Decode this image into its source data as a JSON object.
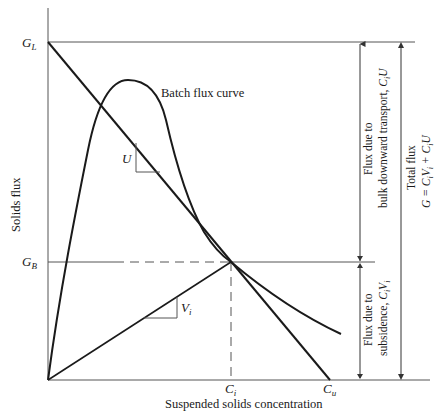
{
  "diagram": {
    "type": "solids flux analysis (batch flux curve with underflow operating line)",
    "axes": {
      "ylabel": "Solids flux",
      "xlabel": "Suspended solids concentration"
    },
    "y_ticks": {
      "GL": {
        "main": "G",
        "sub": "L"
      },
      "GB": {
        "main": "G",
        "sub": "B"
      }
    },
    "x_ticks": {
      "Ci": {
        "main": "C",
        "sub": "i"
      },
      "Cu": {
        "main": "C",
        "sub": "u"
      }
    },
    "curve_label": "Batch flux curve",
    "slope_labels": {
      "U": "U",
      "Vi": {
        "main": "V",
        "sub": "i"
      }
    },
    "annotations": {
      "bulk": {
        "line1": "Flux due to",
        "line2": "bulk downward transport, ",
        "expr_main": "C",
        "expr_sub": "i",
        "expr_tail": "U"
      },
      "subsidence": {
        "line1": "Flux due to",
        "line2": "subsidence, ",
        "expr": "C",
        "expr_sub": "i",
        "expr_mid": "V",
        "expr_sub2": "i"
      },
      "total": {
        "line1": "Total flux",
        "eq_prefix": "G = C",
        "eq_sub1": "i",
        "eq_mid": "V",
        "eq_sub2": "i",
        "eq_plus": " + C",
        "eq_sub3": "i",
        "eq_tail": "U"
      }
    },
    "colors": {
      "line": "#1a1a1a",
      "axis": "#555555"
    }
  }
}
